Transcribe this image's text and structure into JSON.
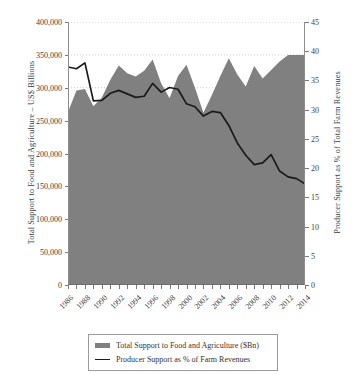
{
  "chart_data": {
    "type": "area",
    "title": "",
    "xlabel": "",
    "ylabel": "Total Support to Food and Agriculture – US$ Billions",
    "y2label": "Producer Support as % of Total Farm Revenues",
    "grid": true,
    "legend_position": "bottom",
    "x": [
      1986,
      1987,
      1988,
      1989,
      1990,
      1991,
      1992,
      1993,
      1994,
      1995,
      1996,
      1997,
      1998,
      1999,
      2000,
      2001,
      2002,
      2003,
      2004,
      2005,
      2006,
      2007,
      2008,
      2009,
      2010,
      2011,
      2012,
      2013,
      2014
    ],
    "xtick_labels": [
      "1986",
      "1988",
      "1990",
      "1992",
      "1994",
      "1996",
      "1998",
      "2000",
      "2002",
      "2004",
      "2006",
      "2008",
      "2010",
      "2012",
      "2014"
    ],
    "ylim": [
      0,
      400000
    ],
    "ytick_labels": [
      "0",
      "50,000",
      "100,000",
      "150,000",
      "200,000",
      "250,000",
      "300,000",
      "350,000",
      "400,000"
    ],
    "ytick_values": [
      0,
      50000,
      100000,
      150000,
      200000,
      250000,
      300000,
      350000,
      400000
    ],
    "y2lim": [
      0,
      45
    ],
    "y2tick_labels": [
      "0",
      "5",
      "10",
      "15",
      "20",
      "25",
      "30",
      "35",
      "40",
      "45"
    ],
    "y2tick_values": [
      0,
      5,
      10,
      15,
      20,
      25,
      30,
      35,
      40,
      45
    ],
    "series": [
      {
        "name": "Total Support to Food and Agriculture ($Bn)",
        "type": "area",
        "axis": "left",
        "color": "#808080",
        "values": [
          263000,
          296000,
          298000,
          272000,
          285000,
          312000,
          334000,
          322000,
          317000,
          326000,
          343000,
          307000,
          284000,
          318000,
          335000,
          300000,
          262000,
          289000,
          318000,
          345000,
          320000,
          302000,
          333000,
          314000,
          327000,
          340000,
          350000,
          350000,
          350000
        ]
      },
      {
        "name": "Producer Support as % of Farm Revenues",
        "type": "line",
        "axis": "right",
        "color": "#1a1a1a",
        "values": [
          37.3,
          37.0,
          38.0,
          31.5,
          31.6,
          32.8,
          33.3,
          32.7,
          32.1,
          32.3,
          34.5,
          33.0,
          33.8,
          33.5,
          31.0,
          30.5,
          28.9,
          29.7,
          29.5,
          27.3,
          24.3,
          22.2,
          20.6,
          20.9,
          22.3,
          19.5,
          18.5,
          18.2,
          17.3
        ]
      }
    ]
  },
  "legend": {
    "items": [
      {
        "label": "Total Support to Food and Agriculture ($Bn)",
        "marker": "area-swatch"
      },
      {
        "label": "Producer Support as % of Farm Revenues",
        "marker": "line-swatch"
      }
    ]
  }
}
